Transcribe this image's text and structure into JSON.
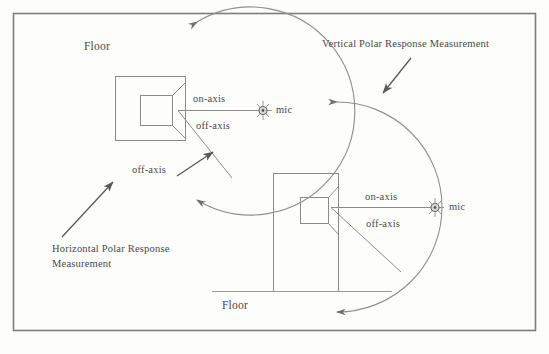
{
  "diagram": {
    "frame": {
      "border_color": "#7a7a7a"
    },
    "ink_color": "#6b6b6b",
    "left_panel": {
      "name": "horizontal-polar-response",
      "floor_label": "Floor",
      "caption_line1": "Horizontal Polar Response",
      "caption_line2": "Measurement",
      "on_axis_label": "on-axis",
      "off_axis_label": "off-axis",
      "off_axis_leader_label": "off-axis",
      "mic_label": "mic"
    },
    "right_panel": {
      "name": "vertical-polar-response",
      "floor_label": "Floor",
      "caption": "Vertical Polar Response Measurement",
      "on_axis_label": "on-axis",
      "off_axis_label": "off-axis",
      "mic_label": "mic"
    }
  }
}
